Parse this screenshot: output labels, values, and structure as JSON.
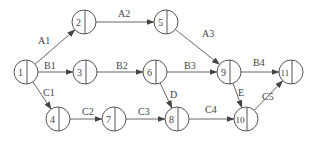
{
  "diagram": {
    "type": "activity-on-arrow network",
    "nodes": [
      {
        "id": "1",
        "label": "1",
        "x": 26,
        "y": 72
      },
      {
        "id": "2",
        "label": "2",
        "x": 84,
        "y": 22
      },
      {
        "id": "3",
        "label": "3",
        "x": 85,
        "y": 72
      },
      {
        "id": "4",
        "label": "4",
        "x": 58,
        "y": 119
      },
      {
        "id": "5",
        "label": "5",
        "x": 166,
        "y": 22
      },
      {
        "id": "6",
        "label": "6",
        "x": 155,
        "y": 72
      },
      {
        "id": "7",
        "label": "7",
        "x": 114,
        "y": 119
      },
      {
        "id": "8",
        "label": "8",
        "x": 177,
        "y": 119
      },
      {
        "id": "9",
        "label": "9",
        "x": 229,
        "y": 72
      },
      {
        "id": "10",
        "label": "10",
        "x": 246,
        "y": 119
      },
      {
        "id": "11",
        "label": "11",
        "x": 291,
        "y": 72
      }
    ],
    "edges": [
      {
        "from": "1",
        "to": "2",
        "label": "A1"
      },
      {
        "from": "2",
        "to": "5",
        "label": "A2"
      },
      {
        "from": "5",
        "to": "9",
        "label": "A3"
      },
      {
        "from": "1",
        "to": "3",
        "label": "B1"
      },
      {
        "from": "3",
        "to": "6",
        "label": "B2"
      },
      {
        "from": "6",
        "to": "9",
        "label": "B3"
      },
      {
        "from": "9",
        "to": "11",
        "label": "B4"
      },
      {
        "from": "1",
        "to": "4",
        "label": "C1"
      },
      {
        "from": "4",
        "to": "7",
        "label": "C2"
      },
      {
        "from": "7",
        "to": "8",
        "label": "C3"
      },
      {
        "from": "8",
        "to": "10",
        "label": "C4"
      },
      {
        "from": "10",
        "to": "11",
        "label": "C5"
      },
      {
        "from": "6",
        "to": "8",
        "label": "D"
      },
      {
        "from": "9",
        "to": "10",
        "label": "E"
      }
    ],
    "edge_label_positions": {
      "A1": [
        38,
        44
      ],
      "A2": [
        118,
        17
      ],
      "A3": [
        202,
        37
      ],
      "B1": [
        44,
        69
      ],
      "B2": [
        116,
        69
      ],
      "B3": [
        184,
        69
      ],
      "B4": [
        253,
        66
      ],
      "C1": [
        43,
        96
      ],
      "C2": [
        82,
        115
      ],
      "C3": [
        138,
        115
      ],
      "C4": [
        205,
        113
      ],
      "C5": [
        262,
        100
      ],
      "D": [
        170,
        98
      ],
      "E": [
        238,
        96
      ]
    },
    "caption": "图 ... 网络图"
  },
  "colors": {
    "stroke": "#555555",
    "text": "#444444",
    "background": "#ffffff"
  },
  "node_radius": 12
}
